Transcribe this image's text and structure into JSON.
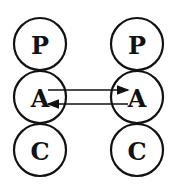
{
  "diagram": {
    "type": "transactional-analysis-ego-states",
    "left_person": {
      "states": [
        "P",
        "A",
        "C"
      ]
    },
    "right_person": {
      "states": [
        "P",
        "A",
        "C"
      ]
    },
    "transactions": [
      {
        "from": "left.A",
        "to": "right.A",
        "direction": "right"
      },
      {
        "from": "right.A",
        "to": "left.A",
        "direction": "left"
      }
    ],
    "colors": {
      "stroke": "#111111",
      "background": "#ffffff"
    }
  }
}
